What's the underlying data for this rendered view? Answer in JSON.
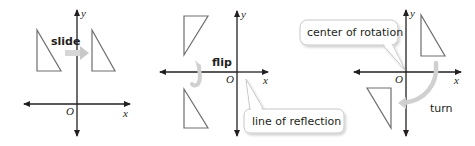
{
  "figure": {
    "panels": [
      {
        "id": "slide",
        "action_label": "slide",
        "axes": {
          "x_label": "x",
          "y_label": "y",
          "origin_label": "O"
        }
      },
      {
        "id": "flip",
        "action_label": "flip",
        "callout": "line of reflection",
        "axes": {
          "x_label": "x",
          "y_label": "y",
          "origin_label": "O"
        }
      },
      {
        "id": "turn",
        "action_label": "turn",
        "callout": "center of rotation",
        "axes": {
          "x_label": "x",
          "y_label": "y",
          "origin_label": "O"
        }
      }
    ],
    "colors": {
      "axis": "#231f20",
      "triangle": "#6d6e71",
      "arrow": "#cfcfcf",
      "callout_border": "#c8c8c8"
    }
  }
}
